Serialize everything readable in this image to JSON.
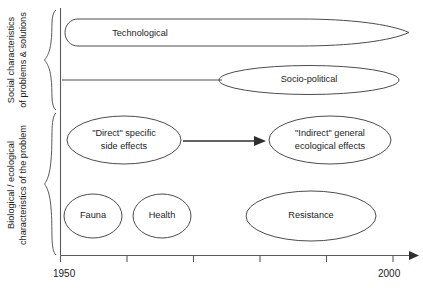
{
  "figure": {
    "type": "timeline-diagram",
    "background_color": "#ffffff",
    "stroke_color": "#4c4c4c",
    "text_color": "#1c1c1c"
  },
  "axis": {
    "name": "time-axis",
    "orientation": "horizontal",
    "start_label": "1950",
    "end_label": "2000",
    "range": [
      1950,
      2000
    ],
    "tick_count": 6,
    "ticks": [
      1950,
      1960,
      1970,
      1980,
      1990,
      2000
    ],
    "labeled_ticks": [
      "1950",
      "2000"
    ],
    "has_arrow_head": true,
    "vertical_axis_label": ""
  },
  "groups": [
    {
      "name": "social-characteristics",
      "line1": "Social characteristics",
      "line2": "of problems & solutions",
      "brace": "top-brace"
    },
    {
      "name": "biological-ecological-characteristics",
      "line1": "Biological / ecological",
      "line2": "characteristics of the problem",
      "brace": "bottom-brace"
    }
  ],
  "nodes": [
    {
      "id": "technological",
      "shape": "tapered-lens",
      "lines": [
        "Technological"
      ],
      "group": "social-characteristics",
      "start_year": 1950,
      "end_year": 2000
    },
    {
      "id": "socio-political",
      "shape": "ellipse-with-leader-line",
      "lines": [
        "Socio-political"
      ],
      "group": "social-characteristics",
      "start_year": 1950,
      "end_year": 1995
    },
    {
      "id": "direct-specific-side-effects",
      "shape": "ellipse",
      "lines": [
        "\"Direct\" specific",
        "side effects"
      ],
      "group": "biological-ecological-characteristics",
      "start_year": 1950,
      "end_year": 1965
    },
    {
      "id": "indirect-general-ecological-effects",
      "shape": "ellipse",
      "lines": [
        "\"Indirect\" general",
        "ecological effects"
      ],
      "group": "biological-ecological-characteristics",
      "start_year": 1980,
      "end_year": 1998
    },
    {
      "id": "fauna",
      "shape": "ellipse",
      "lines": [
        "Fauna"
      ],
      "group": "biological-ecological-characteristics",
      "start_year": 1950,
      "end_year": 1958
    },
    {
      "id": "health",
      "shape": "ellipse",
      "lines": [
        "Health"
      ],
      "group": "biological-ecological-characteristics",
      "start_year": 1960,
      "end_year": 1968
    },
    {
      "id": "resistance",
      "shape": "ellipse",
      "lines": [
        "Resistance"
      ],
      "group": "biological-ecological-characteristics",
      "start_year": 1975,
      "end_year": 1993
    }
  ],
  "connectors": [
    {
      "name": "direct-to-indirect-arrow",
      "from": "direct-specific-side-effects",
      "to": "indirect-general-ecological-effects",
      "style": "solid-arrow"
    }
  ]
}
